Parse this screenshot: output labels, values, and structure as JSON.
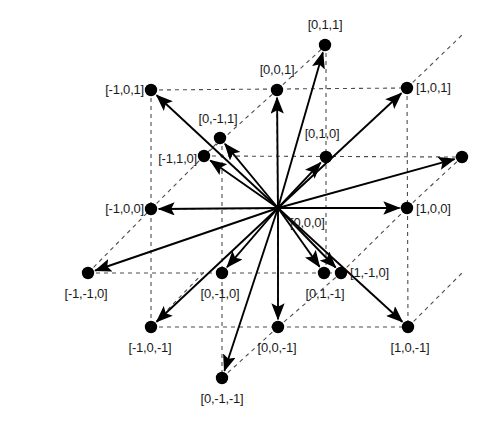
{
  "figure": {
    "width": 489,
    "height": 421,
    "background_color": "#ffffff",
    "stroke_color": "#000000",
    "node_color": "#000000",
    "dash_color": "#4d4d4d",
    "label_color": "#1a1a1a"
  },
  "origin": {
    "id": "n_0_0_0",
    "label": "[0,0,0]",
    "vector": [
      0,
      0,
      0
    ],
    "x": 278,
    "y": 208,
    "label_x": 290,
    "label_y": 222,
    "anchor": "start",
    "has_dot": false
  },
  "nodes": [
    {
      "id": "n_0_1_1",
      "label": "[0,1,1]",
      "vector": [
        0,
        1,
        1
      ],
      "x": 325,
      "y": 45,
      "label_x": 325,
      "label_y": 24,
      "anchor": "middle",
      "arrow": true
    },
    {
      "id": "n_0_0_1",
      "label": "[0,0,1]",
      "vector": [
        0,
        0,
        1
      ],
      "x": 277,
      "y": 90,
      "label_x": 277,
      "label_y": 69,
      "anchor": "middle",
      "arrow": true
    },
    {
      "id": "n_m1_0_1",
      "label": "[-1,0,1]",
      "vector": [
        -1,
        0,
        1
      ],
      "x": 151,
      "y": 90,
      "label_x": 144,
      "label_y": 89,
      "anchor": "end",
      "arrow": true
    },
    {
      "id": "n_1_0_1",
      "label": "[1,0,1]",
      "vector": [
        1,
        0,
        1
      ],
      "x": 407,
      "y": 88,
      "label_x": 416,
      "label_y": 87,
      "anchor": "start",
      "arrow": true
    },
    {
      "id": "n_0_m1_1",
      "label": "[0,-1,1]",
      "vector": [
        0,
        -1,
        1
      ],
      "x": 220,
      "y": 138,
      "label_x": 218,
      "label_y": 118,
      "anchor": "middle",
      "arrow": true
    },
    {
      "id": "n_m1_1_0",
      "label": "[-1,1,0]",
      "vector": [
        -1,
        1,
        0
      ],
      "x": 204,
      "y": 156,
      "label_x": 197,
      "label_y": 158,
      "anchor": "end",
      "arrow": true
    },
    {
      "id": "n_0_1_0",
      "label": "[0,1,0]",
      "vector": [
        0,
        1,
        0
      ],
      "x": 326,
      "y": 157,
      "label_x": 322,
      "label_y": 133,
      "anchor": "middle",
      "arrow": true
    },
    {
      "id": "n_1_1_0",
      "label": "",
      "vector": [
        1,
        1,
        0
      ],
      "x": 462,
      "y": 157,
      "label_x": 462,
      "label_y": 157,
      "anchor": "middle",
      "arrow": true
    },
    {
      "id": "n_m1_0_0",
      "label": "[-1,0,0]",
      "vector": [
        -1,
        0,
        0
      ],
      "x": 151,
      "y": 209,
      "label_x": 144,
      "label_y": 208,
      "anchor": "end",
      "arrow": true
    },
    {
      "id": "n_1_0_0",
      "label": "[1,0,0]",
      "vector": [
        1,
        0,
        0
      ],
      "x": 407,
      "y": 208,
      "label_x": 416,
      "label_y": 208,
      "anchor": "start",
      "arrow": true
    },
    {
      "id": "n_m1_m1_0",
      "label": "[-1,-1,0]",
      "vector": [
        -1,
        -1,
        0
      ],
      "x": 88,
      "y": 273,
      "label_x": 86,
      "label_y": 293,
      "anchor": "middle",
      "arrow": true
    },
    {
      "id": "n_0_m1_0",
      "label": "[0,-1,0]",
      "vector": [
        0,
        -1,
        0
      ],
      "x": 222,
      "y": 273,
      "label_x": 220,
      "label_y": 293,
      "anchor": "middle",
      "arrow": true
    },
    {
      "id": "n_1_m1_0",
      "label": "[1,-1,0]",
      "vector": [
        1,
        -1,
        0
      ],
      "x": 341,
      "y": 273,
      "label_x": 350,
      "label_y": 272,
      "anchor": "start",
      "arrow": true
    },
    {
      "id": "n_0_1_m1",
      "label": "[0,1,-1]",
      "vector": [
        0,
        1,
        -1
      ],
      "x": 324,
      "y": 273,
      "label_x": 325,
      "label_y": 293,
      "anchor": "middle",
      "arrow": true
    },
    {
      "id": "n_m1_0_m1",
      "label": "[-1,0,-1]",
      "vector": [
        -1,
        0,
        -1
      ],
      "x": 151,
      "y": 327,
      "label_x": 150,
      "label_y": 347,
      "anchor": "middle",
      "arrow": true
    },
    {
      "id": "n_0_0_m1",
      "label": "[0,0,-1]",
      "vector": [
        0,
        0,
        -1
      ],
      "x": 278,
      "y": 327,
      "label_x": 277,
      "label_y": 347,
      "anchor": "middle",
      "arrow": true
    },
    {
      "id": "n_1_0_m1",
      "label": "[1,0,-1]",
      "vector": [
        1,
        0,
        -1
      ],
      "x": 408,
      "y": 327,
      "label_x": 410,
      "label_y": 347,
      "anchor": "middle",
      "arrow": true
    },
    {
      "id": "n_0_m1_m1",
      "label": "[0,-1,-1]",
      "vector": [
        0,
        -1,
        -1
      ],
      "x": 222,
      "y": 378,
      "label_x": 222,
      "label_y": 398,
      "anchor": "middle",
      "arrow": true
    }
  ],
  "dashed_lines": [
    {
      "id": "d_top_h",
      "x1": 151,
      "y1": 90,
      "x2": 407,
      "y2": 88
    },
    {
      "id": "d_mid_upper_h",
      "x1": 204,
      "y1": 156,
      "x2": 462,
      "y2": 157
    },
    {
      "id": "d_mid_h",
      "x1": 151,
      "y1": 209,
      "x2": 407,
      "y2": 208
    },
    {
      "id": "d_low_h",
      "x1": 88,
      "y1": 273,
      "x2": 341,
      "y2": 273
    },
    {
      "id": "d_bot_h",
      "x1": 151,
      "y1": 327,
      "x2": 408,
      "y2": 327
    },
    {
      "id": "d_left_v",
      "x1": 151,
      "y1": 90,
      "x2": 151,
      "y2": 327
    },
    {
      "id": "d_cmid_v",
      "x1": 222,
      "y1": 138,
      "x2": 222,
      "y2": 378
    },
    {
      "id": "d_center_v",
      "x1": 277,
      "y1": 90,
      "x2": 278,
      "y2": 327
    },
    {
      "id": "d_rmid_v",
      "x1": 326,
      "y1": 45,
      "x2": 326,
      "y2": 273
    },
    {
      "id": "d_right_v",
      "x1": 407,
      "y1": 88,
      "x2": 408,
      "y2": 327
    },
    {
      "id": "d_diag_tl",
      "x1": 151,
      "y1": 209,
      "x2": 222,
      "y2": 138
    },
    {
      "id": "d_diag_tl2",
      "x1": 204,
      "y1": 156,
      "x2": 277,
      "y2": 90
    },
    {
      "id": "d_diag_tc",
      "x1": 277,
      "y1": 90,
      "x2": 326,
      "y2": 45
    },
    {
      "id": "d_diag_tr",
      "x1": 407,
      "y1": 88,
      "x2": 462,
      "y2": 35
    },
    {
      "id": "d_diag_bl",
      "x1": 88,
      "y1": 273,
      "x2": 151,
      "y2": 209
    },
    {
      "id": "d_diag_bl2",
      "x1": 151,
      "y1": 327,
      "x2": 204,
      "y2": 272
    },
    {
      "id": "d_diag_bc",
      "x1": 222,
      "y1": 378,
      "x2": 278,
      "y2": 327
    },
    {
      "id": "d_diag_br",
      "x1": 278,
      "y1": 327,
      "x2": 341,
      "y2": 273
    },
    {
      "id": "d_diag_rr",
      "x1": 408,
      "y1": 327,
      "x2": 462,
      "y2": 273
    },
    {
      "id": "d_diag_rm",
      "x1": 407,
      "y1": 208,
      "x2": 462,
      "y2": 157
    },
    {
      "id": "d_diag_cm",
      "x1": 341,
      "y1": 273,
      "x2": 407,
      "y2": 208
    }
  ]
}
